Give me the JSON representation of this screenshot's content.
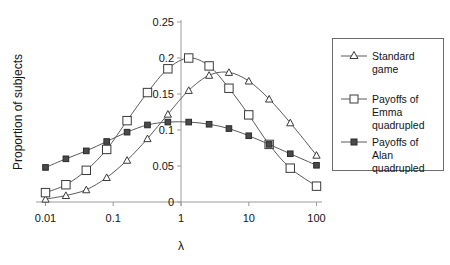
{
  "chart_data": {
    "type": "line",
    "title": "",
    "xlabel": "λ",
    "ylabel": "Proportion of subjects",
    "xscale": "log",
    "xlim": [
      0.01,
      100
    ],
    "ylim": [
      0,
      0.25
    ],
    "xticks": [
      "0.01",
      "0.1",
      "1",
      "10",
      "100"
    ],
    "xtick_values": [
      0.01,
      0.1,
      1,
      10,
      100
    ],
    "yticks": [
      "0",
      "0.05",
      "0.1",
      "0.15",
      "0.2",
      "0.25"
    ],
    "ytick_values": [
      0,
      0.05,
      0.1,
      0.15,
      0.2,
      0.25
    ],
    "grid": false,
    "legend_position": "right",
    "x": [
      0.01,
      0.02,
      0.04,
      0.08,
      0.16,
      0.32,
      0.64,
      1.3,
      2.6,
      5.1,
      10,
      20,
      41,
      100
    ],
    "series": [
      {
        "name": "Standard game",
        "marker": "open-triangle",
        "values": [
          0.004,
          0.009,
          0.017,
          0.034,
          0.058,
          0.088,
          0.122,
          0.155,
          0.176,
          0.18,
          0.168,
          0.143,
          0.11,
          0.065
        ]
      },
      {
        "name": "Payoffs of Emma quadrupled",
        "marker": "open-square",
        "values": [
          0.013,
          0.024,
          0.044,
          0.073,
          0.113,
          0.152,
          0.185,
          0.2,
          0.189,
          0.158,
          0.121,
          0.08,
          0.047,
          0.022
        ]
      },
      {
        "name": "Payoffs of Alan quadrupled",
        "marker": "solid-square",
        "values": [
          0.048,
          0.06,
          0.071,
          0.084,
          0.097,
          0.107,
          0.111,
          0.111,
          0.108,
          0.102,
          0.092,
          0.08,
          0.067,
          0.051
        ]
      }
    ]
  },
  "legend": {
    "entries": [
      {
        "label_line1": "Standard",
        "label_line2": "game",
        "label_line3": ""
      },
      {
        "label_line1": "Payoffs of",
        "label_line2": "Emma",
        "label_line3": "quadrupled"
      },
      {
        "label_line1": "Payoffs of",
        "label_line2": "Alan",
        "label_line3": "quadrupled"
      }
    ]
  },
  "axes": {
    "y_title": "Proportion of subjects",
    "x_title": "λ"
  },
  "colors": {
    "line": "#5a5a5a",
    "axis": "#9a9a9a",
    "text": "#141414",
    "legend_border": "#6b6b6b",
    "marker_fill_open": "#ffffff",
    "marker_fill_solid": "#4a4a4a"
  }
}
